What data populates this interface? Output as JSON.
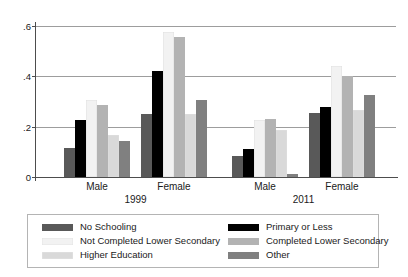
{
  "chart_data": {
    "type": "bar",
    "title": "",
    "subtitle": "",
    "xlabel": "",
    "ylabel": "",
    "ylim": [
      0,
      0.6
    ],
    "yticks": [
      "0",
      ".2",
      ".4",
      ".6"
    ],
    "ytick_values": [
      0,
      0.2,
      0.4,
      0.6
    ],
    "grid": true,
    "legend_position": "bottom",
    "groups": [
      {
        "period": "1999",
        "category": "Male"
      },
      {
        "period": "1999",
        "category": "Female"
      },
      {
        "period": "2011",
        "category": "Male"
      },
      {
        "period": "2011",
        "category": "Female"
      }
    ],
    "categories": [
      "Male 1999",
      "Female 1999",
      "Male 2011",
      "Female 2011"
    ],
    "series": [
      {
        "name": "No Schooling",
        "color": "#595959",
        "values": [
          0.115,
          0.25,
          0.085,
          0.255
        ]
      },
      {
        "name": "Primary or Less",
        "color": "#000000",
        "values": [
          0.225,
          0.42,
          0.11,
          0.28
        ]
      },
      {
        "name": "Not Completed Lower Secondary",
        "color": "#f2f2f2",
        "values": [
          0.305,
          0.575,
          0.225,
          0.44
        ]
      },
      {
        "name": "Completed Lower Secondary",
        "color": "#b3b3b3",
        "values": [
          0.285,
          0.555,
          0.23,
          0.4
        ]
      },
      {
        "name": "Higher Education",
        "color": "#d9d9d9",
        "values": [
          0.165,
          0.25,
          0.185,
          0.265
        ]
      },
      {
        "name": "Other",
        "color": "#808080",
        "values": [
          0.145,
          0.305,
          0.01,
          0.325
        ]
      }
    ]
  },
  "axis": {
    "y_tick_labels": [
      "0",
      ".2",
      ".4",
      ".6"
    ]
  },
  "categories_labels": {
    "male_1999": "Male",
    "female_1999": "Female",
    "male_2011": "Male",
    "female_2011": "Female"
  },
  "period_labels": {
    "period_1": "1999",
    "period_2": "2011"
  },
  "legend": {
    "items": [
      {
        "label": "No Schooling",
        "color": "#595959"
      },
      {
        "label": "Primary or Less",
        "color": "#000000"
      },
      {
        "label": "Not Completed Lower Secondary",
        "color": "#f2f2f2"
      },
      {
        "label": "Completed Lower Secondary",
        "color": "#b3b3b3"
      },
      {
        "label": "Higher Education",
        "color": "#d9d9d9"
      },
      {
        "label": "Other",
        "color": "#808080"
      }
    ]
  }
}
